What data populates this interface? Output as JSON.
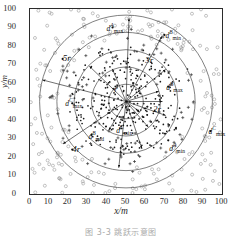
{
  "chart_data": {
    "type": "scatter",
    "title": "",
    "xlabel": "x/m",
    "ylabel": "y/m",
    "xlim": [
      0,
      100
    ],
    "ylim": [
      0,
      100
    ],
    "xticks": [
      0,
      10,
      20,
      30,
      40,
      50,
      60,
      70,
      80,
      90,
      100
    ],
    "yticks": [
      0,
      10,
      20,
      30,
      40,
      50,
      60,
      70,
      80,
      90,
      100
    ],
    "grid": false,
    "legend": "none",
    "center": [
      50,
      50
    ],
    "ring_radius_unit_r": 9,
    "rings": [
      {
        "label": "r",
        "radius": 9
      },
      {
        "label": "2r",
        "radius": 18
      },
      {
        "label": "3r",
        "radius": 27
      },
      {
        "label": "4r",
        "radius": 36
      },
      {
        "label": "5r",
        "radius": 45
      }
    ],
    "series": [
      {
        "name": "inner-nodes",
        "marker": "dot",
        "color": "#1a1a1a",
        "count": 260,
        "description": "dense small dots inside radius 3r"
      },
      {
        "name": "mid-nodes",
        "marker": "plus",
        "color": "#2b2b2b",
        "count": 90,
        "description": "plus markers between 2r and 4r"
      },
      {
        "name": "outer-nodes",
        "marker": "circle",
        "color": "#9a9a9a",
        "count": 210,
        "description": "open circles outside radius 4r"
      }
    ],
    "annotations": [
      {
        "id": "dA-max",
        "text_main": "d",
        "sup": "A",
        "sub": "max",
        "x": 43,
        "y": 90
      },
      {
        "id": "dB-min",
        "text_main": "d",
        "sup": "B",
        "sub": "min",
        "x": 70,
        "y": 86
      },
      {
        "id": "dB-max",
        "text_main": "d",
        "sup": "B",
        "sub": "max",
        "x": 72,
        "y": 58
      },
      {
        "id": "dC-max-l",
        "text_main": "d",
        "sup": "C",
        "sub": "max",
        "x": 22,
        "y": 49
      },
      {
        "id": "dC-min",
        "text_main": "d",
        "sup": "C",
        "sub": "min",
        "x": 48,
        "y": 38
      },
      {
        "id": "dB-mid",
        "text_main": "d",
        "sup": "B",
        "sub": "mid",
        "x": 32,
        "y": 32
      },
      {
        "id": "dA-min",
        "text_main": "d",
        "sup": "A",
        "sub": "min",
        "x": 72,
        "y": 29
      },
      {
        "id": "dC-max-r",
        "text_main": "d",
        "sup": "C",
        "sub": "max",
        "x": 94,
        "y": 34
      }
    ],
    "ring_labels": [
      {
        "label": "5r",
        "x": 17,
        "y": 73
      },
      {
        "label": "3r",
        "x": 60,
        "y": 72
      },
      {
        "label": "r",
        "x": 44,
        "y": 56
      },
      {
        "label": "2r",
        "x": 64,
        "y": 46
      },
      {
        "label": "4r",
        "x": 22,
        "y": 24
      }
    ]
  },
  "axis": {
    "xlabel": "x/m",
    "ylabel": "y/m",
    "xticks": [
      "0",
      "10",
      "20",
      "30",
      "40",
      "50",
      "60",
      "70",
      "80",
      "90",
      "100"
    ],
    "yticks": [
      "100",
      "90",
      "80",
      "70",
      "60",
      "50",
      "40",
      "30",
      "20",
      "10",
      "0"
    ]
  },
  "labels": {
    "dA_max": {
      "base": "d",
      "sup": "A",
      "sub": "max"
    },
    "dB_min": {
      "base": "d",
      "sup": "B",
      "sub": "min"
    },
    "dB_max": {
      "base": "d",
      "sup": "B",
      "sub": "max"
    },
    "dC_max_left": {
      "base": "d",
      "sup": "C",
      "sub": "max"
    },
    "dC_min": {
      "base": "d",
      "sup": "C",
      "sub": "min"
    },
    "dB_mid": {
      "base": "d",
      "sup": "B",
      "sub": "mid"
    },
    "dA_min": {
      "base": "d",
      "sup": "A",
      "sub": "min"
    },
    "dC_max_right": {
      "base": "d",
      "sup": "C",
      "sub": "max"
    },
    "r1": "r",
    "r2": "2r",
    "r3": "3r",
    "r4": "4r",
    "r5": "5r"
  },
  "caption": "图 3-3   跳跃示意图",
  "colors": {
    "axis": "#2b2b2b",
    "inner_marker": "#1a1a1a",
    "outer_marker": "#9a9a9a",
    "ring": "#4a4a4a",
    "caption": "#8d8d8d"
  }
}
